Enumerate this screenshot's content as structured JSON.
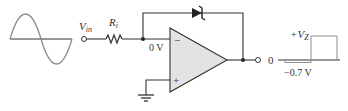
{
  "diagram": {
    "type": "zener-limited comparator circuit",
    "labels": {
      "input": "V",
      "input_sub": "in",
      "resistor": "R",
      "resistor_sub": "i",
      "virtual_ground": "0 V",
      "opamp_inverting": "−",
      "opamp_noninverting": "+",
      "output_zero": "0",
      "output_high": "+V",
      "output_high_sub": "Z",
      "output_low": "−0.7 V"
    },
    "components": [
      {
        "name": "sine-input-waveform"
      },
      {
        "name": "input-terminal"
      },
      {
        "name": "input-resistor"
      },
      {
        "name": "zener-diode-feedback"
      },
      {
        "name": "op-amp"
      },
      {
        "name": "ground"
      },
      {
        "name": "output-terminal"
      },
      {
        "name": "output-square-waveform"
      }
    ],
    "colors": {
      "wire": "#333333",
      "opamp_fill": "#e3e3e3",
      "waveform_gray": "#8c8c8c"
    }
  }
}
